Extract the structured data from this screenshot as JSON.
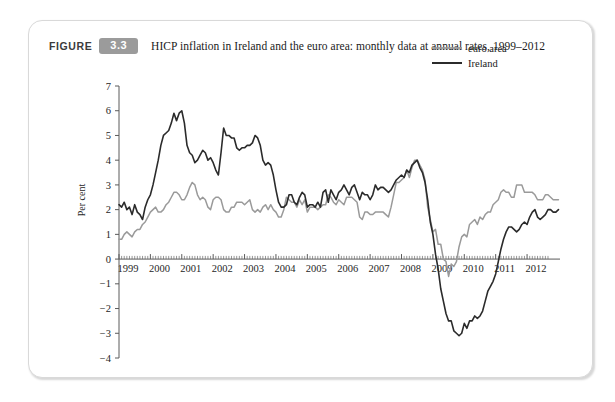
{
  "figure": {
    "label": "FIGURE",
    "number": "3.3",
    "title": "HICP inflation in Ireland and the euro area: monthly data at annual rates, 1999–2012"
  },
  "colors": {
    "euro_area": "#9a9a9a",
    "ireland": "#2b2b2b",
    "badge": "#9b9b9b",
    "axis": "#5a5a5a",
    "card_border": "#d9d9d9"
  },
  "chart_data": {
    "type": "line",
    "title": "HICP inflation in Ireland and the euro area: monthly data at annual rates, 1999–2012",
    "xlabel": "",
    "ylabel": "Per cent",
    "ylim": [
      -4,
      7
    ],
    "xlim": [
      1999.0,
      2012.6667
    ],
    "grid": false,
    "legend_position": "top-right",
    "yticks": [
      7,
      6,
      5,
      4,
      3,
      2,
      1,
      0,
      -1,
      -2,
      -3,
      -4
    ],
    "ytick_labels": [
      "7",
      "6",
      "5",
      "4",
      "3",
      "2",
      "1",
      "0",
      "−1",
      "−2",
      "−3",
      "−4"
    ],
    "xticks": [
      1999,
      2000,
      2001,
      2002,
      2003,
      2004,
      2005,
      2006,
      2007,
      2008,
      2009,
      2010,
      2011,
      2012
    ],
    "xtick_labels": [
      "1999",
      "2000",
      "2001",
      "2002",
      "2003",
      "2004",
      "2005",
      "2006",
      "2007",
      "2008",
      "2009",
      "2010",
      "2011",
      "2012"
    ],
    "x_minor_ticks_per_major": 12,
    "x_start": 1999.0,
    "x_step_months": 1,
    "series": [
      {
        "name": "euro area",
        "color": "#9a9a9a",
        "values": [
          0.8,
          0.8,
          1.0,
          1.1,
          1.0,
          0.9,
          1.1,
          1.2,
          1.2,
          1.4,
          1.5,
          1.7,
          1.9,
          2.0,
          2.1,
          1.9,
          1.9,
          2.0,
          2.2,
          2.3,
          2.5,
          2.7,
          2.7,
          2.6,
          2.4,
          2.4,
          2.6,
          2.9,
          3.1,
          3.0,
          2.6,
          2.4,
          2.5,
          2.4,
          2.1,
          2.0,
          2.4,
          2.5,
          2.5,
          2.4,
          2.0,
          1.9,
          1.9,
          2.1,
          2.1,
          2.3,
          2.3,
          2.3,
          2.2,
          2.3,
          2.4,
          2.0,
          1.9,
          2.0,
          1.9,
          2.1,
          2.2,
          2.0,
          2.2,
          2.0,
          1.9,
          1.7,
          1.7,
          2.0,
          2.5,
          2.4,
          2.3,
          2.3,
          2.1,
          2.4,
          2.2,
          2.4,
          1.9,
          2.1,
          2.1,
          2.1,
          2.0,
          2.1,
          2.2,
          2.2,
          2.6,
          2.5,
          2.3,
          2.2,
          2.4,
          2.3,
          2.2,
          2.5,
          2.5,
          2.5,
          2.4,
          2.3,
          1.7,
          1.6,
          1.9,
          1.9,
          1.8,
          1.8,
          1.9,
          1.9,
          1.9,
          1.9,
          1.8,
          1.7,
          2.1,
          2.6,
          3.1,
          3.1,
          3.2,
          3.3,
          3.6,
          3.3,
          3.7,
          4.0,
          4.0,
          3.8,
          3.6,
          3.2,
          2.1,
          1.6,
          1.1,
          1.2,
          0.6,
          0.6,
          0.0,
          -0.1,
          -0.7,
          -0.2,
          -0.3,
          -0.1,
          0.5,
          0.9,
          1.0,
          0.9,
          1.4,
          1.5,
          1.6,
          1.4,
          1.7,
          1.6,
          1.8,
          1.9,
          1.9,
          2.2,
          2.3,
          2.4,
          2.7,
          2.8,
          2.7,
          2.7,
          2.5,
          2.5,
          3.0,
          3.0,
          3.0,
          2.7,
          2.7,
          2.7,
          2.7,
          2.6,
          2.4,
          2.4,
          2.4,
          2.6,
          2.6,
          2.5,
          2.4,
          2.4,
          2.4
        ]
      },
      {
        "name": "Ireland",
        "color": "#2b2b2b",
        "values": [
          2.2,
          2.1,
          2.3,
          2.0,
          2.1,
          1.8,
          2.2,
          1.9,
          1.8,
          1.6,
          2.1,
          2.4,
          2.6,
          3.0,
          3.5,
          4.0,
          4.6,
          5.0,
          5.1,
          5.2,
          5.5,
          5.9,
          5.6,
          5.9,
          6.0,
          5.5,
          4.6,
          4.3,
          4.2,
          3.9,
          4.0,
          4.2,
          4.4,
          4.3,
          4.0,
          4.1,
          3.9,
          3.6,
          3.4,
          4.3,
          5.3,
          5.0,
          5.0,
          4.9,
          4.9,
          4.5,
          4.4,
          4.5,
          4.5,
          4.6,
          4.6,
          4.7,
          5.0,
          4.9,
          4.6,
          4.0,
          3.8,
          3.9,
          3.8,
          3.4,
          2.8,
          2.3,
          2.1,
          2.1,
          2.2,
          2.6,
          2.6,
          2.3,
          2.2,
          2.5,
          2.7,
          2.6,
          2.1,
          2.2,
          2.2,
          2.1,
          2.3,
          2.1,
          2.7,
          2.8,
          2.3,
          2.8,
          2.6,
          2.4,
          2.7,
          2.8,
          3.0,
          2.8,
          2.6,
          2.9,
          3.0,
          2.7,
          2.4,
          2.7,
          2.6,
          2.6,
          2.4,
          2.6,
          3.0,
          2.8,
          2.9,
          2.9,
          2.8,
          2.7,
          2.8,
          3.0,
          3.2,
          3.3,
          3.4,
          3.3,
          3.6,
          3.5,
          3.8,
          3.9,
          4.0,
          3.7,
          3.5,
          3.1,
          2.4,
          1.5,
          1.0,
          0.2,
          -0.4,
          -1.2,
          -1.7,
          -2.2,
          -2.5,
          -2.5,
          -2.9,
          -3.0,
          -3.1,
          -3.0,
          -2.6,
          -2.8,
          -2.5,
          -2.5,
          -2.3,
          -2.4,
          -2.3,
          -2.1,
          -1.7,
          -1.3,
          -1.1,
          -0.9,
          -0.6,
          -0.1,
          0.4,
          0.8,
          1.1,
          1.3,
          1.3,
          1.2,
          1.1,
          1.2,
          1.4,
          1.5,
          1.4,
          1.7,
          1.9,
          2.0,
          1.7,
          1.6,
          1.7,
          1.8,
          2.0,
          2.0,
          1.9,
          1.9,
          2.0
        ]
      }
    ]
  },
  "legend": {
    "items": [
      {
        "label": "euro area",
        "color": "#9a9a9a"
      },
      {
        "label": "Ireland",
        "color": "#2b2b2b"
      }
    ]
  }
}
